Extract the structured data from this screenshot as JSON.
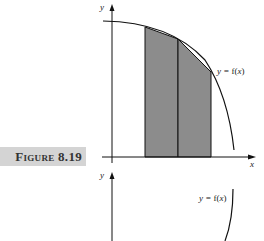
{
  "figure": {
    "label": "Figure 8.19"
  },
  "graph_top": {
    "y_axis_label": "y",
    "x_axis_label": "x",
    "curve_label_prefix": "y = ",
    "curve_label_fn": "f(",
    "curve_label_var": "x",
    "curve_label_suffix": ")"
  },
  "graph_bottom": {
    "y_axis_label": "y",
    "curve_label_prefix": "y = ",
    "curve_label_fn": "f(",
    "curve_label_var": "x",
    "curve_label_suffix": ")"
  },
  "colors": {
    "shading": "#8c8c8c",
    "label_bg": "#d4d4d4",
    "ink": "#111111"
  }
}
